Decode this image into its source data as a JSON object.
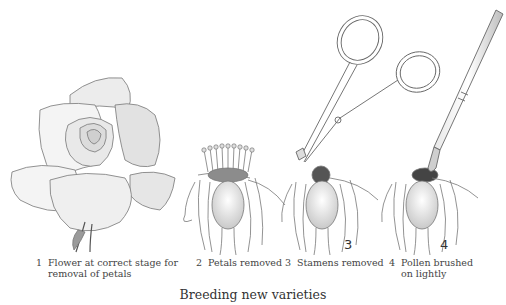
{
  "figure": {
    "title": "Breeding new varieties",
    "steps": [
      {
        "number": "1",
        "caption_line1": "Flower at correct stage for",
        "caption_line2": "removal of petals"
      },
      {
        "number": "2",
        "caption_line1": "Petals removed",
        "caption_line2": ""
      },
      {
        "number": "3",
        "caption_line1": "Stamens removed",
        "caption_line2": ""
      },
      {
        "number": "4",
        "caption_line1": "Pollen brushed",
        "caption_line2": "on lightly"
      }
    ],
    "inline_labels": [
      "3",
      "4"
    ],
    "icons": [
      "rose-illustration",
      "flower-petals-removed-illustration",
      "scissors-illustration",
      "paintbrush-illustration"
    ]
  }
}
